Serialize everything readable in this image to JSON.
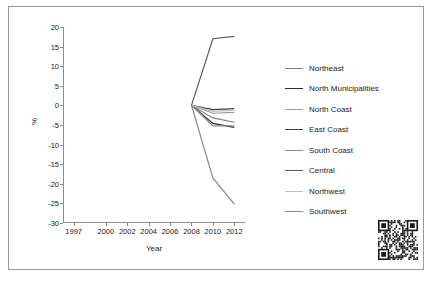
{
  "chart_data": {
    "type": "line",
    "title": "",
    "xlabel": "Year",
    "ylabel": "%",
    "xlim": [
      1996,
      2013
    ],
    "ylim": [
      -30,
      20
    ],
    "xticks": [
      "1997",
      "2000",
      "2002",
      "2004",
      "2006",
      "2008",
      "2010",
      "2012"
    ],
    "xtick_values": [
      1997,
      2000,
      2002,
      2004,
      2006,
      2008,
      2010,
      2012
    ],
    "yticks": [
      "20",
      "15",
      "10",
      "5",
      "0",
      "-5",
      "-10",
      "-15",
      "-20",
      "-25",
      "-30"
    ],
    "ytick_values": [
      20,
      15,
      10,
      5,
      0,
      -5,
      -10,
      -15,
      -20,
      -25,
      -30
    ],
    "grid": false,
    "legend_position": "right",
    "x": [
      2008,
      2010,
      2012
    ],
    "series": [
      {
        "name": "Northeast",
        "color": "#7f7f7f",
        "values": [
          0,
          -3.2,
          -4.3
        ]
      },
      {
        "name": "North Municipalities",
        "color": "#2b2b2b",
        "values": [
          0,
          -4.6,
          -5.6
        ]
      },
      {
        "name": "North Coast",
        "color": "#9d9d9d",
        "values": [
          0,
          -2.0,
          -1.8
        ]
      },
      {
        "name": "East Coast",
        "color": "#3f3f3f",
        "values": [
          0,
          -1.1,
          -0.8
        ]
      },
      {
        "name": "South Coast",
        "color": "#8c8c8c",
        "values": [
          0,
          -5.2,
          -5.2
        ]
      },
      {
        "name": "Central",
        "color": "#5a5a5a",
        "values": [
          0,
          17.0,
          17.6
        ]
      },
      {
        "name": "Northwest",
        "color": "#bdbdbd",
        "values": [
          0,
          -1.5,
          -1.2
        ]
      },
      {
        "name": "Southwest",
        "color": "#888888",
        "values": [
          0,
          -18.5,
          -25.2
        ]
      }
    ]
  },
  "legend": {
    "items": [
      {
        "label": "Northeast"
      },
      {
        "label": "North Municipalities"
      },
      {
        "label": "North Coast"
      },
      {
        "label": "East Coast"
      },
      {
        "label": "South Coast"
      },
      {
        "label": "Central"
      },
      {
        "label": "Northwest"
      },
      {
        "label": "Southwest"
      }
    ]
  },
  "qr": {
    "alt": "qr-code"
  }
}
